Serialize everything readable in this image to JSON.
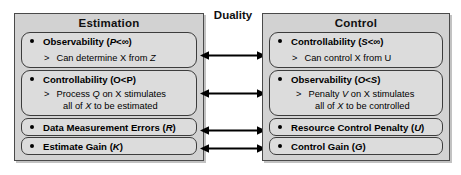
{
  "diagram": {
    "title_center": "Duality",
    "colors": {
      "panel_fill": "#d2d2d2",
      "pill_fill": "#dcdcdc",
      "border": "#3c3c3c",
      "text": "#000000",
      "background": "#ffffff"
    }
  },
  "estimation": {
    "title": "Estimation",
    "items": [
      {
        "head_pre": "Observability (",
        "head_sym": "P",
        "head_post": "<∞)",
        "sub_marker": ">",
        "sub_pre": "Can determine X from ",
        "sub_sym": "Z",
        "sub_post": "",
        "sub_line2": ""
      },
      {
        "head_pre": "Controllability (O<P)",
        "head_sym": "",
        "head_post": "",
        "sub_marker": ">",
        "sub_pre": "Process ",
        "sub_sym": "Q",
        "sub_post": " on X stimulates",
        "sub_line2_pre": "all of ",
        "sub_line2_sym": "X",
        "sub_line2_post": " to be estimated"
      },
      {
        "head_pre": "Data Measurement Errors (",
        "head_sym": "R",
        "head_post": ")"
      },
      {
        "head_pre": "Estimate Gain (",
        "head_sym": "K",
        "head_post": ")"
      }
    ]
  },
  "control": {
    "title": "Control",
    "items": [
      {
        "head_pre": "Controllability (",
        "head_sym": "S",
        "head_post": "<∞)",
        "sub_marker": ">",
        "sub_pre": "Can control X from U",
        "sub_sym": "",
        "sub_post": "",
        "sub_line2": ""
      },
      {
        "head_pre": "Observability (",
        "head_sym": "O<S",
        "head_post": ")",
        "sub_marker": ">",
        "sub_pre": "Penalty ",
        "sub_sym": "V",
        "sub_post": " on X stimulates",
        "sub_line2_pre": "all of ",
        "sub_line2_sym": "X",
        "sub_line2_post": " to be controlled"
      },
      {
        "head_pre": "Resource Control Penalty (",
        "head_sym": "U",
        "head_post": ")"
      },
      {
        "head_pre": "Control Gain (",
        "head_sym": "G",
        "head_post": ")"
      }
    ]
  },
  "connectors": {
    "count": 4,
    "style": "double-headed-arrow",
    "labels": [
      "observability-controllability-link",
      "controllability-observability-link",
      "errors-penalty-link",
      "gain-gain-link"
    ]
  }
}
